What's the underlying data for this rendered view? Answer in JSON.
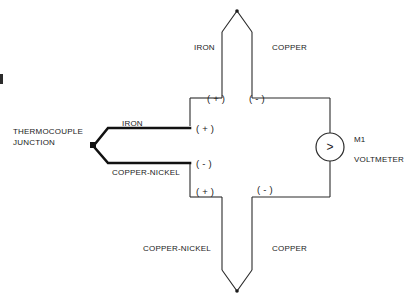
{
  "diagram": {
    "stroke_color": "#2b2b2b",
    "lead_color": "#111111",
    "text_color": "#1a1a1a",
    "background": "#ffffff"
  },
  "labels": {
    "thermocouple_junction_line1": "THERMOCOUPLE",
    "thermocouple_junction_line2": "JUNCTION",
    "lead_iron": "IRON",
    "lead_copper_nickel": "COPPER-NICKEL",
    "top_left_material": "IRON",
    "top_right_material": "COPPER",
    "bottom_left_material": "COPPER-NICKEL",
    "bottom_right_material": "COPPER",
    "meter_id": "M1",
    "meter_name": "VOLTMETER",
    "meter_symbol": ">"
  },
  "polarity": {
    "top_left": "( + )",
    "top_right": "( - )",
    "mid_iron": "( + )",
    "mid_copper_nickel": "( - )",
    "bottom_left": "( + )",
    "bottom_right": "( - )"
  }
}
